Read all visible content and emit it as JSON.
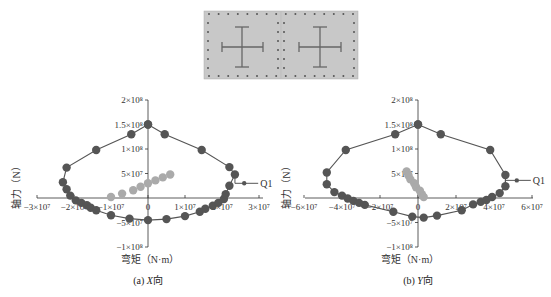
{
  "section_image": {
    "description": "cross-section with two cross-shaped steel members in a dotted rebar frame",
    "panels": 2,
    "background": "#c8c8c8"
  },
  "chart_data": [
    {
      "type": "scatter",
      "title": "(a) X向",
      "caption_prefix": "(a) ",
      "caption_italic": "X",
      "caption_suffix": "向",
      "xlabel": "弯矩（N·m）",
      "ylabel": "轴力（N）",
      "xlim": [
        -30000000.0,
        30000000.0
      ],
      "ylim": [
        -100000000.0,
        200000000.0
      ],
      "x_ticks": [
        -30000000.0,
        -20000000.0,
        -10000000.0,
        0,
        10000000.0,
        20000000.0,
        30000000.0
      ],
      "x_tick_labels": [
        "−3×10⁷",
        "−2×10⁷",
        "−1×10⁷",
        "0",
        "1×10⁷",
        "2×10⁷",
        "3×10⁷"
      ],
      "y_ticks": [
        -100000000.0,
        -50000000.0,
        50000000.0,
        100000000.0,
        150000000.0,
        200000000.0
      ],
      "y_tick_labels": [
        "−1×10⁸",
        "−5×10⁷",
        "5×10⁷",
        "1×10⁸",
        "1.5×10⁸",
        "2×10⁸"
      ],
      "annotation": "Q1",
      "series": [
        {
          "name": "interaction curve",
          "color": "#555555",
          "line": true,
          "points": [
            [
              0,
              150000000.0
            ],
            [
              -4500000.0,
              130000000.0
            ],
            [
              -14000000.0,
              98000000.0
            ],
            [
              -22000000.0,
              62000000.0
            ],
            [
              -23000000.0,
              32000000.0
            ],
            [
              -22000000.0,
              18000000.0
            ],
            [
              -21000000.0,
              5000000.0
            ],
            [
              -19500000.0,
              -5000000.0
            ],
            [
              -18000000.0,
              -10000000.0
            ],
            [
              -16500000.0,
              -15000000.0
            ],
            [
              -15500000.0,
              -20000000.0
            ],
            [
              -14000000.0,
              -25000000.0
            ],
            [
              -10000000.0,
              -35000000.0
            ],
            [
              -5000000.0,
              -42000000.0
            ],
            [
              0,
              -45000000.0
            ],
            [
              5000000.0,
              -43000000.0
            ],
            [
              10000000.0,
              -37000000.0
            ],
            [
              14000000.0,
              -28000000.0
            ],
            [
              15500000.0,
              -22000000.0
            ],
            [
              17500000.0,
              -16000000.0
            ],
            [
              19000000.0,
              -10000000.0
            ],
            [
              20500000.0,
              -2000000.0
            ],
            [
              21000000.0,
              8000000.0
            ],
            [
              22000000.0,
              25000000.0
            ],
            [
              23500000.0,
              48000000.0
            ],
            [
              22000000.0,
              63000000.0
            ],
            [
              14500000.0,
              98000000.0
            ],
            [
              4500000.0,
              130000000.0
            ],
            [
              0,
              150000000.0
            ]
          ]
        },
        {
          "name": "Q1 load point",
          "color": "#555555",
          "points": [
            [
              26000000.0,
              30000000.0
            ]
          ]
        },
        {
          "name": "demand points",
          "color": "#aaaaaa",
          "points": [
            [
              -10000000.0,
              2000000.0
            ],
            [
              -7000000.0,
              9000000.0
            ],
            [
              -4000000.0,
              16000000.0
            ],
            [
              -2000000.0,
              23000000.0
            ],
            [
              0,
              30000000.0
            ],
            [
              2000000.0,
              36000000.0
            ],
            [
              4000000.0,
              42000000.0
            ],
            [
              6000000.0,
              48000000.0
            ]
          ]
        }
      ]
    },
    {
      "type": "scatter",
      "title": "(b) Y向",
      "caption_prefix": "(b) ",
      "caption_italic": "Y",
      "caption_suffix": "向",
      "xlabel": "弯矩（N·m）",
      "ylabel": "轴力（N）",
      "xlim": [
        -60000000.0,
        60000000.0
      ],
      "ylim": [
        -100000000.0,
        200000000.0
      ],
      "x_ticks": [
        -60000000.0,
        -40000000.0,
        -20000000.0,
        0,
        20000000.0,
        40000000.0,
        60000000.0
      ],
      "x_tick_labels": [
        "−6×10⁷",
        "−4×10⁷",
        "−2×10⁷",
        "0",
        "2×10⁷",
        "4×10⁷",
        "6×10⁷"
      ],
      "y_ticks": [
        -100000000.0,
        -50000000.0,
        50000000.0,
        100000000.0,
        150000000.0,
        200000000.0
      ],
      "y_tick_labels": [
        "−1×10⁸",
        "−5×10⁷",
        "5×10⁷",
        "1×10⁸",
        "1.5×10⁸",
        "2×10⁸"
      ],
      "annotation": "Q1",
      "series": [
        {
          "name": "interaction curve",
          "color": "#555555",
          "line": true,
          "points": [
            [
              0,
              150000000.0
            ],
            [
              -12000000.0,
              130000000.0
            ],
            [
              -38000000.0,
              98000000.0
            ],
            [
              -48000000.0,
              52000000.0
            ],
            [
              -48000000.0,
              28000000.0
            ],
            [
              -44000000.0,
              12000000.0
            ],
            [
              -40000000.0,
              5000000.0
            ],
            [
              -37000000.0,
              -1000000.0
            ],
            [
              -34000000.0,
              -6000000.0
            ],
            [
              -31000000.0,
              -10000000.0
            ],
            [
              -28000000.0,
              -14000000.0
            ],
            [
              -13000000.0,
              -28000000.0
            ],
            [
              -3000000.0,
              -38000000.0
            ],
            [
              3000000.0,
              -40000000.0
            ],
            [
              10000000.0,
              -36000000.0
            ],
            [
              23000000.0,
              -25000000.0
            ],
            [
              29000000.0,
              -13000000.0
            ],
            [
              33000000.0,
              -8000000.0
            ],
            [
              36000000.0,
              -4000000.0
            ],
            [
              39000000.0,
              2000000.0
            ],
            [
              43000000.0,
              10000000.0
            ],
            [
              46000000.0,
              24000000.0
            ],
            [
              46000000.0,
              47000000.0
            ],
            [
              38000000.0,
              98000000.0
            ],
            [
              12000000.0,
              130000000.0
            ],
            [
              0,
              150000000.0
            ]
          ]
        },
        {
          "name": "Q1 load point",
          "color": "#555555",
          "points": [
            [
              52000000.0,
              36000000.0
            ]
          ]
        },
        {
          "name": "demand points",
          "color": "#aaaaaa",
          "points": [
            [
              -6000000.0,
              54000000.0
            ],
            [
              -5000000.0,
              46000000.0
            ],
            [
              -4000000.0,
              38000000.0
            ],
            [
              -2000000.0,
              30000000.0
            ],
            [
              -1000000.0,
              22000000.0
            ],
            [
              1000000.0,
              15000000.0
            ],
            [
              2000000.0,
              8000000.0
            ],
            [
              3000000.0,
              2000000.0
            ]
          ]
        }
      ]
    }
  ]
}
